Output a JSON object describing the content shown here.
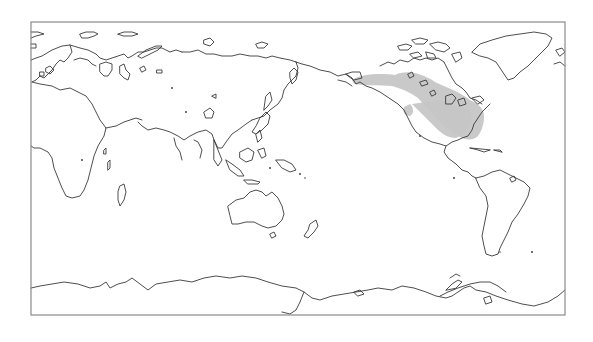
{
  "map": {
    "title": "",
    "projection": "equirectangular, Pacific-centered (0°E to 360°E)",
    "frame": {
      "left": 31,
      "top": 22,
      "right": 565,
      "bottom": 315,
      "stroke": "#8a8a8a"
    },
    "background": "#ffffff",
    "coastline_color": "#3a3a3a",
    "shaded_region": {
      "label": "North America shaded area",
      "color": "#c6c6c6",
      "extent": "Alaska / Yukon southeast through central Canada to the eastern United States (Great Lakes to Gulf Coast)"
    },
    "regions_visible": [
      "Europe",
      "Africa",
      "Asia",
      "Australia",
      "New Zealand",
      "Indonesia",
      "North America",
      "Greenland",
      "Central America",
      "South America",
      "Antarctica"
    ]
  }
}
